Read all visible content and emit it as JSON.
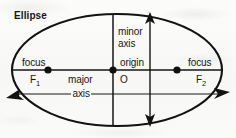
{
  "figure": {
    "title": "Ellipse",
    "labels": {
      "focus_left": "focus",
      "focus_left_point": "F1",
      "focus_right": "focus",
      "focus_right_point": "F2",
      "origin": "origin",
      "origin_point": "O",
      "minor_axis_line1": "minor",
      "minor_axis_line2": "axis",
      "major_axis_line1": "major",
      "major_axis_line2": "axis"
    },
    "colors": {
      "ink": "#151515",
      "paper": "#fbfbfa"
    }
  },
  "chart_data": {
    "type": "diagram",
    "title": "Ellipse",
    "shape": "ellipse",
    "center": {
      "label": "O",
      "name": "origin",
      "x": 113,
      "y": 70
    },
    "semi_major_axis_px": 105,
    "semi_minor_axis_px": 56,
    "foci": [
      {
        "label": "F1",
        "name": "focus",
        "x": 48,
        "y": 70
      },
      {
        "label": "F2",
        "name": "focus",
        "x": 177,
        "y": 70
      }
    ],
    "axes": [
      {
        "name": "major axis",
        "orientation": "horizontal",
        "from_x": 8,
        "to_x": 226,
        "y": 94,
        "arrows": "both"
      },
      {
        "name": "minor axis",
        "orientation": "vertical",
        "x": 150,
        "from_y": 15,
        "to_y": 124,
        "arrows": "both"
      }
    ],
    "annotations": [
      "focus",
      "F1",
      "focus",
      "F2",
      "origin",
      "O",
      "minor axis",
      "major axis"
    ]
  }
}
